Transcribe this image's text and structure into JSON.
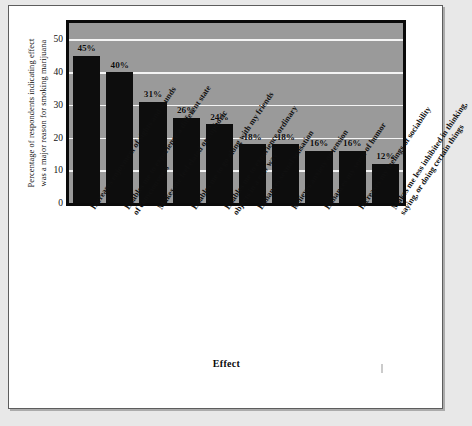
{
  "figure": {
    "background_color": "#ffffff",
    "page_background_color": "#e8e8e8",
    "plot_background_color": "#9a9a9a",
    "bar_color": "#0d0d0d",
    "gridline_color": "#f4f4f4",
    "border_color": "#0a0a0a"
  },
  "chart_data": {
    "type": "bar",
    "title": "",
    "xlabel": "Effect",
    "ylabel_line1": "Percentage of respondents indicating effect",
    "ylabel_line2": "was a major reason for smoking marijuana",
    "ylabel": "Percentage of respondents indicating effect was a major reason for smoking marijuana",
    "categories": [
      "Increases enjoyment of sights and sounds",
      "Enables me to experience a different state of consciousness",
      "Makes me feel elated or euphoric",
      "Enables me to go along with my friends",
      "Enables me to experience ordinary objects  in a new way",
      "Enhances sexual sensation",
      "Relieves anxiety or tension",
      "Enhances my sense of humor",
      "Increases my feelings of sociability",
      "Makes me less inhibited in thinking, saying, or doing certain things"
    ],
    "category_lines": [
      [
        "Increases enjoyment of sights and sounds"
      ],
      [
        "Enables me to experience a different state",
        "of consciousness"
      ],
      [
        "Makes me feel elated or euphoric"
      ],
      [
        "Enables me to go along with my friends"
      ],
      [
        "Enables me to experience ordinary",
        "objects  in a new way"
      ],
      [
        "Enhances sexual sensation"
      ],
      [
        "Relieves anxiety or tension"
      ],
      [
        "Enhances my sense of humor"
      ],
      [
        "Increases my feelings of sociability"
      ],
      [
        "Makes me less inhibited in thinking,",
        "saying, or doing certain things"
      ]
    ],
    "values": [
      45,
      40,
      31,
      26,
      24,
      18,
      18,
      16,
      16,
      12
    ],
    "data_labels": [
      "45%",
      "40%",
      "31%",
      "26%",
      "24%",
      "18%",
      "18%",
      "16%",
      "16%",
      "12%"
    ],
    "ylim": [
      0,
      55
    ],
    "yticks": [
      0,
      10,
      20,
      30,
      40,
      50
    ],
    "ytick_labels": [
      "0",
      "10",
      "20",
      "30",
      "40",
      "50"
    ],
    "grid": true,
    "grid_axis": "y",
    "legend": null,
    "legend_position": "none"
  }
}
